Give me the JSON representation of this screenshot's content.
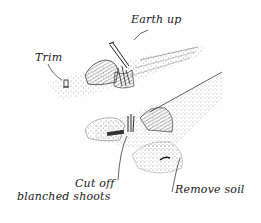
{
  "figure": {
    "background_color": "#fefefe",
    "ink_color": "#1a1a1a"
  },
  "labels": {
    "earth_up": "Earth up",
    "trim": "Trim",
    "cut_off_line1": "Cut off",
    "cut_off_line2": "blanched shoots",
    "remove_soil": "Remove soil"
  },
  "elements": {
    "upper_row": "ridged-soil-row-upper",
    "lower_row": "ridged-soil-row-lower",
    "spade": "spade-tool",
    "knife": "knife-tool",
    "stump": "trimmed-stump"
  }
}
